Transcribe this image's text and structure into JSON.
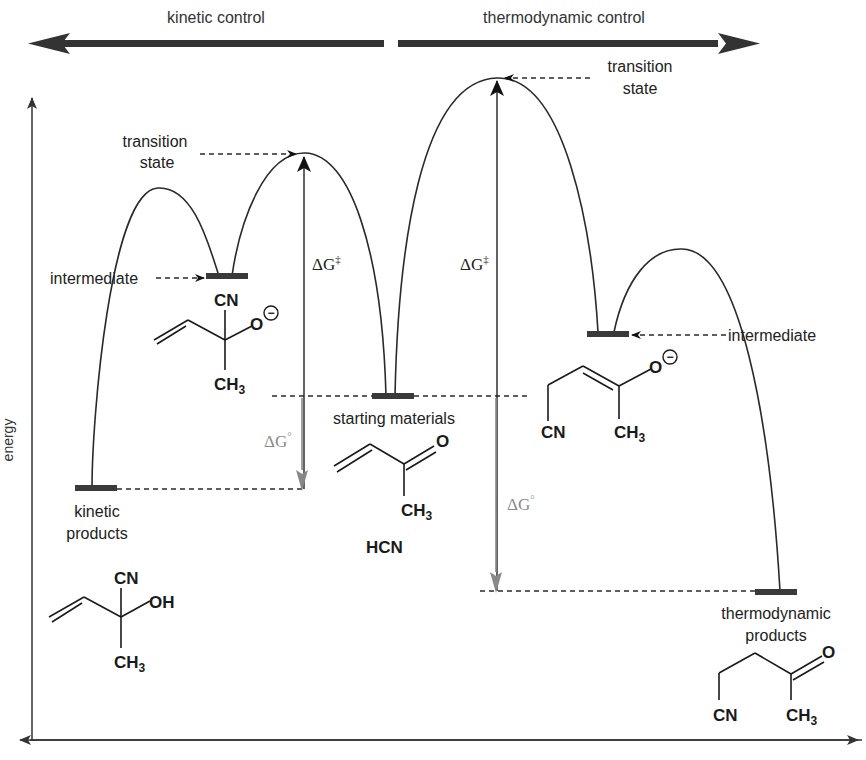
{
  "header": {
    "left_label": "kinetic control",
    "right_label": "thermodynamic control"
  },
  "axes": {
    "y_label": "energy"
  },
  "labels": {
    "transition_state_left_line1": "transition",
    "transition_state_left_line2": "state",
    "transition_state_right_line1": "transition",
    "transition_state_right_line2": "state",
    "intermediate_left": "intermediate",
    "intermediate_right": "intermediate",
    "starting_materials": "starting materials",
    "kinetic_products_line1": "kinetic",
    "kinetic_products_line2": "products",
    "thermo_products_line1": "thermodynamic",
    "thermo_products_line2": "products"
  },
  "energy_labels": {
    "dG_act_left": "ΔG",
    "dG_act_left_sup": "‡",
    "dG_act_right": "ΔG",
    "dG_act_right_sup": "‡",
    "dG_std_left": "ΔG",
    "dG_std_left_sup": "°",
    "dG_std_right": "ΔG",
    "dG_std_right_sup": "°"
  },
  "molecules": {
    "intermediate_left": {
      "cn": "CN",
      "o": "O",
      "charge": "−",
      "ch": "CH",
      "sub": "3"
    },
    "intermediate_right": {
      "cn": "CN",
      "o": "O",
      "charge": "−",
      "ch": "CH",
      "sub": "3"
    },
    "starting": {
      "o": "O",
      "ch": "CH",
      "sub": "3",
      "reagent": "HCN"
    },
    "kinetic_product": {
      "cn": "CN",
      "oh": "OH",
      "ch": "CH",
      "sub": "3"
    },
    "thermo_product": {
      "o": "O",
      "cn": "CN",
      "ch": "CH",
      "sub": "3"
    }
  },
  "colors": {
    "curve": "#2a2a2a",
    "level_bar": "#3a3a3a",
    "dG_standard_arrow": "#888888",
    "background": "#ffffff"
  }
}
